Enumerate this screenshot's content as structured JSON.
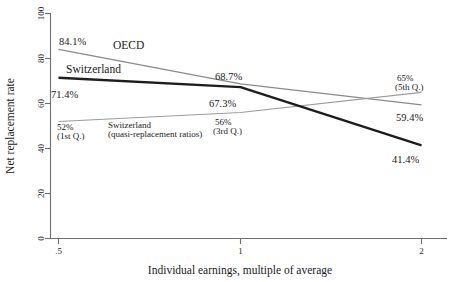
{
  "chart_data": {
    "type": "line",
    "title": "",
    "xlabel": "Individual earnings, multiple of average",
    "ylabel": "Net replacement rate",
    "x": [
      0.5,
      1,
      2
    ],
    "xticklabels": [
      ".5",
      "1",
      "2"
    ],
    "xscale": "log",
    "ylim": [
      0,
      100
    ],
    "yticks": [
      0,
      20,
      40,
      60,
      80,
      100
    ],
    "yticklabels": [
      "0",
      "20",
      "40",
      "60",
      "80",
      "100"
    ],
    "grid": false,
    "legend": "inline-labels",
    "series": [
      {
        "name": "OECD",
        "values": [
          84.1,
          68.7,
          59.4
        ],
        "color": "#8a8a8a",
        "width": 1.2,
        "label": "OECD"
      },
      {
        "name": "Switzerland",
        "values": [
          71.4,
          67.3,
          41.4
        ],
        "color": "#1d1d1d",
        "width": 2.4,
        "label": "Switzerland"
      },
      {
        "name": "Switzerland (quasi-replacement ratios)",
        "values": [
          52,
          56,
          65
        ],
        "color": "#9b9b9b",
        "width": 1.2,
        "label_line1": "Switzerland",
        "label_line2": "(quasi-replacement ratios)"
      }
    ],
    "annotations": [
      {
        "text": "84.1%",
        "series": "OECD",
        "x": 0.5
      },
      {
        "text": "68.7%",
        "series": "OECD",
        "x": 1
      },
      {
        "text": "59.4%",
        "series": "OECD",
        "x": 2
      },
      {
        "text": "71.4%",
        "series": "Switzerland",
        "x": 0.5
      },
      {
        "text": "67.3%",
        "series": "Switzerland",
        "x": 1
      },
      {
        "text": "41.4%",
        "series": "Switzerland",
        "x": 2
      },
      {
        "text": "52%",
        "sub": "(1st Q.)",
        "series": "Switzerland (quasi-replacement ratios)",
        "x": 0.5
      },
      {
        "text": "56%",
        "sub": "(3rd Q.)",
        "series": "Switzerland (quasi-replacement ratios)",
        "x": 1
      },
      {
        "text": "65%",
        "sub": "(5th Q.)",
        "series": "Switzerland (quasi-replacement ratios)",
        "x": 2
      }
    ]
  },
  "labels": {
    "y_axis_title": "Net replacement rate",
    "x_axis_title": "Individual earnings, multiple of average",
    "ytick_100": "100",
    "ytick_80": "80",
    "ytick_60": "60",
    "ytick_40": "40",
    "ytick_20": "20",
    "ytick_0": "0",
    "xtick_half": ".5",
    "xtick_one": "1",
    "xtick_two": "2",
    "oecd": "OECD",
    "switzerland": "Switzerland",
    "quasi_line1": "Switzerland",
    "quasi_line2": "(quasi-replacement ratios)",
    "v_84_1": "84.1%",
    "v_68_7": "68.7%",
    "v_59_4": "59.4%",
    "v_71_4": "71.4%",
    "v_67_3": "67.3%",
    "v_41_4": "41.4%",
    "v_52": "52%",
    "v_52_sub": "(1st Q.)",
    "v_56": "56%",
    "v_56_sub": "(3rd Q.)",
    "v_65": "65%",
    "v_65_sub": "(5th Q.)"
  },
  "colors": {
    "oecd_line": "#8a8a8a",
    "switzerland_line": "#1d1d1d",
    "quasi_line": "#9b9b9b",
    "axis": "#6f6f6f",
    "text": "#1a1a1a",
    "background": "#ffffff"
  }
}
